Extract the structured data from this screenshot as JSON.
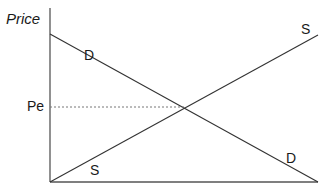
{
  "diagram": {
    "y_axis_label": "Price",
    "equilibrium_price_label": "Pe",
    "demand_label_top": "D",
    "demand_label_bottom": "D",
    "supply_label_top": "S",
    "supply_label_bottom": "S",
    "colors": {
      "line": "#333333",
      "axis": "#555555",
      "dashed": "#777777",
      "text": "#1a1a1a"
    },
    "geometry": {
      "origin": [
        50,
        182
      ],
      "y_axis_top": [
        50,
        8
      ],
      "x_axis_end": [
        318,
        182
      ],
      "demand": [
        [
          50,
          34
        ],
        [
          318,
          182
        ]
      ],
      "supply": [
        [
          50,
          182
        ],
        [
          318,
          35
        ]
      ],
      "equilibrium": [
        184,
        107
      ]
    }
  }
}
